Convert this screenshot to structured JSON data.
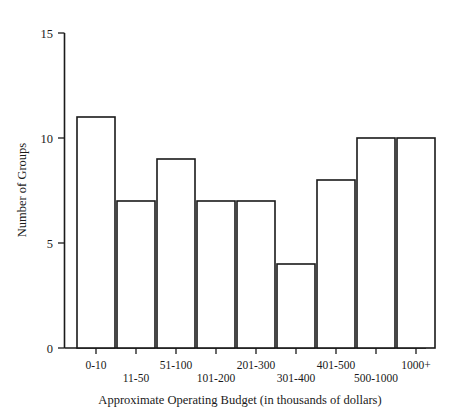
{
  "chart_data": {
    "type": "bar",
    "title": "",
    "subtitle": "",
    "xlabel": "Approximate Operating Budget (in thousands of dollars)",
    "ylabel": "Number of Groups",
    "categories": [
      "0-10",
      "11-50",
      "51-100",
      "101-200",
      "201-300",
      "301-400",
      "401-500",
      "500-1000",
      "1000+"
    ],
    "values": [
      6,
      11,
      7,
      9,
      7,
      7,
      4,
      8,
      10
    ],
    "ylim": [
      0,
      15
    ],
    "ytick_labels": [
      "0",
      "5",
      "10",
      "15"
    ],
    "ytick_values": [
      0,
      5,
      10,
      15
    ],
    "grid": false,
    "legend": false,
    "legend_position": "none",
    "bar_fill": "#ffffff",
    "bar_stroke": "#1a1a1a",
    "axis_color": "#1a1a1a",
    "background": "#ffffff",
    "label_stagger": "alternating-two-rows"
  }
}
